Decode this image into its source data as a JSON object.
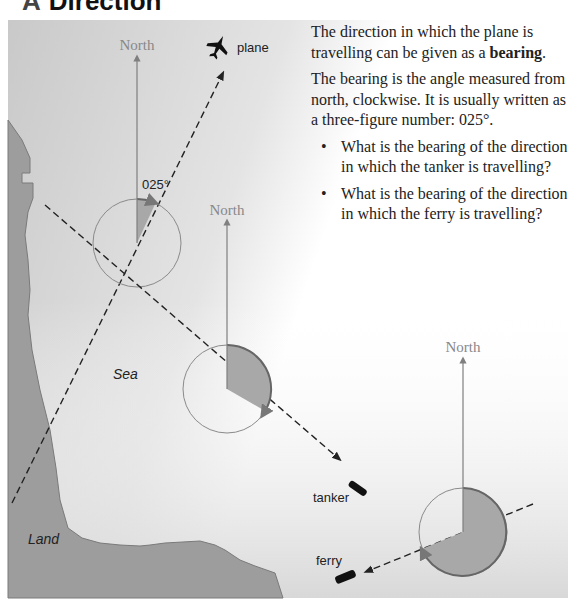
{
  "heading": {
    "letter": "A",
    "title": "Direction"
  },
  "text_panel": {
    "para1_before": "The direction in which the plane is travelling can be given as a ",
    "para1_bold": "bearing",
    "para1_after": ".",
    "para2": "The bearing is the angle measured from north, clockwise. It is usually written as a three-figure number: 025°.",
    "questions": [
      "What is the bearing of the direction in which the tanker is travelling?",
      "What is the bearing of the direction in which the ferry is travelling?"
    ]
  },
  "diagram": {
    "north_label": "North",
    "angle_label": "025°",
    "sea_label": "Sea",
    "land_label": "Land",
    "vehicles": [
      {
        "name": "plane",
        "label": "plane",
        "bearing_deg": 25
      },
      {
        "name": "tanker",
        "label": "tanker",
        "bearing_deg": 120
      },
      {
        "name": "ferry",
        "label": "ferry",
        "bearing_deg": 245
      }
    ],
    "colors": {
      "sector_fill": "#a8a8a8",
      "circle_stroke": "#8a8a8a",
      "north_arrow": "#7f7f7f",
      "land_fill": "#9b9b9b",
      "sea_fill": "#d6d6d6",
      "dashed_line": "#222222"
    }
  }
}
